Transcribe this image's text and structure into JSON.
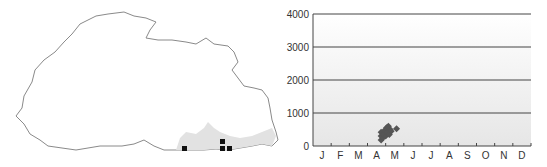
{
  "map": {
    "region": "Bhutan outline",
    "outline_color": "#8a8a8a",
    "shading_color": "#dcdcdc",
    "marker_color": "#111111",
    "markers": [
      {
        "x": 184,
        "y": 148
      },
      {
        "x": 222,
        "y": 141
      },
      {
        "x": 222,
        "y": 148
      },
      {
        "x": 229,
        "y": 148
      }
    ]
  },
  "chart_data": {
    "type": "scatter",
    "title": "",
    "xlabel": "",
    "ylabel": "",
    "categories": [
      "J",
      "F",
      "M",
      "A",
      "M",
      "J",
      "J",
      "A",
      "S",
      "O",
      "N",
      "D"
    ],
    "y_ticks": [
      0,
      1000,
      2000,
      3000,
      4000
    ],
    "ylim": [
      0,
      4000
    ],
    "grid": "horizontal at 1000,2000,3000,4000",
    "marker_color": "#555555",
    "series": [
      {
        "name": "records",
        "points": [
          {
            "month": 3.75,
            "y": 180
          },
          {
            "month": 3.75,
            "y": 300
          },
          {
            "month": 3.75,
            "y": 420
          },
          {
            "month": 3.85,
            "y": 250
          },
          {
            "month": 3.9,
            "y": 350
          },
          {
            "month": 3.95,
            "y": 480
          },
          {
            "month": 4.0,
            "y": 300
          },
          {
            "month": 4.05,
            "y": 550
          },
          {
            "month": 4.1,
            "y": 400
          },
          {
            "month": 4.15,
            "y": 600
          },
          {
            "month": 4.2,
            "y": 350
          },
          {
            "month": 4.25,
            "y": 500
          },
          {
            "month": 4.3,
            "y": 450
          },
          {
            "month": 4.6,
            "y": 520
          }
        ]
      }
    ]
  }
}
